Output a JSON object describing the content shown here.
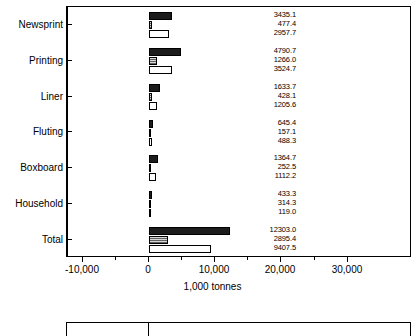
{
  "chart_data": {
    "type": "bar",
    "orientation": "horizontal",
    "title": "Scandinavia",
    "xlabel": "1,000 tonnes",
    "ylabel": "",
    "xlim": [
      -10000,
      30000
    ],
    "xticks": [
      -10000,
      0,
      10000,
      20000,
      30000
    ],
    "xticklabels": [
      "-10,000",
      "0",
      "10,000",
      "20,000",
      "30,000"
    ],
    "grid": false,
    "legend": "none",
    "categories": [
      "Newsprint",
      "Printing",
      "Liner",
      "Fluting",
      "Boxboard",
      "Household",
      "Total"
    ],
    "series": [
      {
        "name": "series-1",
        "style": "solid-black",
        "color": "#1c1c1c",
        "values": [
          3435.1,
          4790.7,
          1633.7,
          645.4,
          1364.7,
          433.3,
          12303.0
        ]
      },
      {
        "name": "series-2",
        "style": "hatched-gray",
        "color": "#d6d6d6",
        "values": [
          477.4,
          1266.0,
          428.1,
          157.1,
          252.5,
          314.3,
          2895.4
        ]
      },
      {
        "name": "series-3",
        "style": "outlined-white",
        "color": "#ffffff",
        "values": [
          2957.7,
          3524.7,
          1205.6,
          488.3,
          1112.2,
          119.0,
          9407.5
        ]
      }
    ],
    "value_labels": [
      [
        "3435.1",
        "477.4",
        "2957.7"
      ],
      [
        "4790.7",
        "1266.0",
        "3524.7"
      ],
      [
        "1633.7",
        "428.1",
        "1205.6"
      ],
      [
        "645.4",
        "157.1",
        "488.3"
      ],
      [
        "1364.7",
        "252.5",
        "1112.2"
      ],
      [
        "433.3",
        "314.3",
        "119.0"
      ],
      [
        "12303.0",
        "2895.4",
        "9407.5"
      ]
    ]
  }
}
